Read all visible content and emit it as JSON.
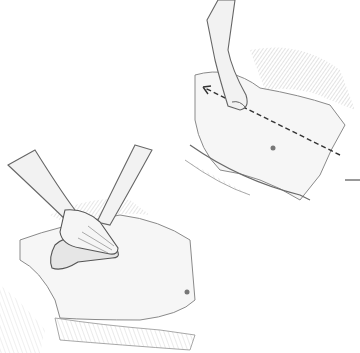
{
  "image": {
    "width": 360,
    "height": 353,
    "style": "pencil sketch illustration",
    "background": "#ffffff",
    "ink": "#555555",
    "shade": "#c8c8c8"
  },
  "panels": [
    {
      "name": "top-right",
      "subject": "hand pointing along abdomen with dashed arrow",
      "features": [
        "pointing-hand",
        "dashed-arrow",
        "navel",
        "drape"
      ]
    },
    {
      "name": "bottom-left",
      "subject": "two overlapping hands placed flat on abdomen",
      "features": [
        "stacked-hands",
        "navel",
        "drape"
      ]
    }
  ],
  "annotations": {
    "leader_line": "short horizontal line at right edge"
  }
}
